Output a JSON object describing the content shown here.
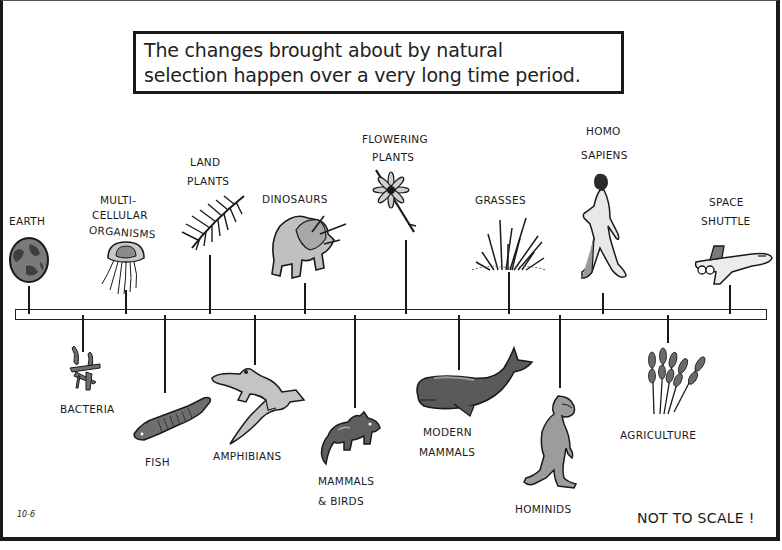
{
  "title": {
    "line1": "The changes brought about by natural",
    "line2": "selection happen over a very long time period."
  },
  "timeline": {
    "above": [
      {
        "id": "earth",
        "label_lines": [
          "EARTH"
        ],
        "x": 29,
        "icon": "earth-globe"
      },
      {
        "id": "multicellular",
        "label_lines": [
          "MULTI-",
          "CELLULAR",
          "ORGANISMS"
        ],
        "x": 126,
        "icon": "jellyfish"
      },
      {
        "id": "land-plants",
        "label_lines": [
          "LAND",
          "PLANTS"
        ],
        "x": 210,
        "icon": "fern-frond"
      },
      {
        "id": "dinosaurs",
        "label_lines": [
          "DINOSAURS"
        ],
        "x": 305,
        "icon": "triceratops"
      },
      {
        "id": "flowering-plants",
        "label_lines": [
          "FLOWERING",
          "PLANTS"
        ],
        "x": 406,
        "icon": "flower"
      },
      {
        "id": "grasses",
        "label_lines": [
          "GRASSES"
        ],
        "x": 509,
        "icon": "grass-tuft"
      },
      {
        "id": "homo-sapiens",
        "label_lines": [
          "HOMO",
          "SAPIENS"
        ],
        "x": 603,
        "icon": "walking-human"
      },
      {
        "id": "space-shuttle",
        "label_lines": [
          "SPACE",
          "SHUTTLE"
        ],
        "x": 730,
        "icon": "space-shuttle"
      }
    ],
    "below": [
      {
        "id": "bacteria",
        "label_lines": [
          "BACTERIA"
        ],
        "x": 83,
        "icon": "bacteria-cluster"
      },
      {
        "id": "fish",
        "label_lines": [
          "FISH"
        ],
        "x": 165,
        "icon": "fish"
      },
      {
        "id": "amphibians",
        "label_lines": [
          "AMPHIBIANS"
        ],
        "x": 255,
        "icon": "salamander"
      },
      {
        "id": "mammals-birds",
        "label_lines": [
          "MAMMALS",
          "& BIRDS"
        ],
        "x": 355,
        "icon": "small-mammal"
      },
      {
        "id": "modern-mammals",
        "label_lines": [
          "MODERN",
          "MAMMALS"
        ],
        "x": 459,
        "icon": "whale"
      },
      {
        "id": "hominids",
        "label_lines": [
          "HOMINIDS"
        ],
        "x": 560,
        "icon": "ape"
      },
      {
        "id": "agriculture",
        "label_lines": [
          "AGRICULTURE"
        ],
        "x": 668,
        "icon": "wheat-stalks"
      }
    ]
  },
  "labels": {
    "earth": "EARTH",
    "multicellular_1": "MULTI-",
    "multicellular_2": "CELLULAR",
    "multicellular_3": "ORGANISMS",
    "land_plants_1": "LAND",
    "land_plants_2": "PLANTS",
    "dinosaurs": "DINOSAURS",
    "flowering_1": "FLOWERING",
    "flowering_2": "PLANTS",
    "grasses": "GRASSES",
    "homo_1": "HOMO",
    "homo_2": "SAPIENS",
    "shuttle_1": "SPACE",
    "shuttle_2": "SHUTTLE",
    "bacteria": "BACTERIA",
    "fish": "FISH",
    "amphibians": "AMPHIBIANS",
    "mammals_1": "MAMMALS",
    "mammals_2": "& BIRDS",
    "modern_1": "MODERN",
    "modern_2": "MAMMALS",
    "hominids": "HOMINIDS",
    "agriculture": "AGRICULTURE"
  },
  "footer": {
    "code": "10-6",
    "note": "NOT TO SCALE !"
  },
  "colors": {
    "ink": "#1a1a1a",
    "fill_light": "#c4c4c4",
    "fill_mid": "#8a8a8a",
    "fill_dark": "#5e5e5e",
    "background": "#ffffff"
  }
}
